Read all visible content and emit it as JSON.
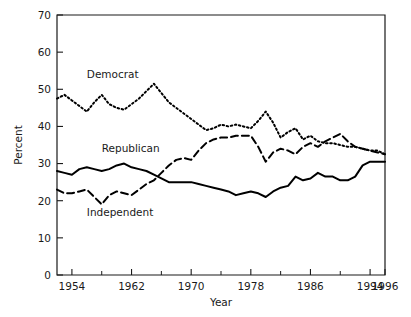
{
  "chart_data": {
    "type": "line",
    "title": "",
    "xlabel": "Year",
    "ylabel": "Percent",
    "xlim": [
      1952,
      1996
    ],
    "ylim": [
      0,
      70
    ],
    "grid": false,
    "legend_position": "inline-labels",
    "y_ticks": [
      0,
      10,
      20,
      30,
      40,
      50,
      60,
      70
    ],
    "y_tick_labels": [
      "0",
      "10",
      "20",
      "30",
      "40",
      "50",
      "60",
      "70"
    ],
    "x_ticks": [
      1954,
      1962,
      1970,
      1978,
      1986,
      1994,
      1996
    ],
    "x_tick_labels": [
      "1954",
      "1962",
      "1970",
      "1978",
      "1986",
      "1994",
      "1996"
    ],
    "x_minor_ticks": [
      1958,
      1966,
      1974,
      1982,
      1990
    ],
    "x": [
      1952,
      1953,
      1954,
      1955,
      1956,
      1957,
      1958,
      1959,
      1960,
      1961,
      1962,
      1963,
      1964,
      1965,
      1966,
      1967,
      1968,
      1969,
      1970,
      1971,
      1972,
      1973,
      1974,
      1975,
      1976,
      1977,
      1978,
      1979,
      1980,
      1981,
      1982,
      1983,
      1984,
      1985,
      1986,
      1987,
      1988,
      1989,
      1990,
      1991,
      1992,
      1993,
      1994,
      1995,
      1996
    ],
    "series": [
      {
        "name": "Democrat",
        "style": "dotted",
        "label_x": 1956,
        "label_y": 53,
        "values": [
          47.5,
          48.5,
          47.0,
          45.5,
          44.0,
          46.5,
          48.5,
          46.0,
          45.0,
          44.5,
          46.0,
          47.5,
          49.5,
          51.5,
          49.0,
          46.5,
          45.0,
          43.5,
          42.0,
          40.5,
          39.0,
          39.5,
          40.5,
          40.0,
          40.5,
          40.0,
          39.5,
          41.5,
          44.0,
          41.0,
          37.0,
          38.5,
          39.5,
          36.5,
          37.5,
          36.0,
          35.5,
          35.5,
          35.0,
          34.5,
          34.5,
          34.0,
          33.5,
          33.5,
          32.5
        ]
      },
      {
        "name": "Republican",
        "style": "solid",
        "label_x": 1958,
        "label_y": 33,
        "values": [
          28.0,
          27.5,
          27.0,
          28.5,
          29.0,
          28.5,
          28.0,
          28.5,
          29.5,
          30.0,
          29.0,
          28.5,
          28.0,
          27.0,
          26.0,
          25.0,
          25.0,
          25.0,
          25.0,
          24.5,
          24.0,
          23.5,
          23.0,
          22.5,
          21.5,
          22.0,
          22.5,
          22.0,
          21.0,
          22.5,
          23.5,
          24.0,
          26.5,
          25.5,
          26.0,
          27.5,
          26.5,
          26.5,
          25.5,
          25.5,
          26.5,
          29.5,
          30.5,
          30.5,
          30.5
        ]
      },
      {
        "name": "Independent",
        "style": "dashed",
        "label_x": 1956,
        "label_y": 16,
        "values": [
          23.0,
          22.0,
          22.0,
          22.5,
          23.0,
          21.0,
          19.0,
          21.5,
          22.5,
          22.0,
          21.5,
          23.0,
          24.5,
          25.5,
          27.5,
          29.5,
          31.0,
          31.5,
          31.0,
          33.5,
          35.5,
          36.5,
          37.0,
          37.0,
          37.5,
          37.5,
          37.5,
          34.5,
          30.5,
          33.0,
          34.0,
          33.5,
          32.5,
          34.5,
          35.5,
          34.5,
          36.0,
          37.0,
          38.0,
          36.0,
          34.5,
          34.0,
          33.5,
          33.0,
          32.5
        ]
      }
    ]
  },
  "labels": {
    "democrat": "Democrat",
    "republican": "Republican",
    "independent": "Independent",
    "x_axis_title": "Year",
    "y_axis_title": "Percent"
  },
  "colors": {
    "line": "#000000",
    "axis": "#1a1a1a",
    "background": "#ffffff"
  }
}
